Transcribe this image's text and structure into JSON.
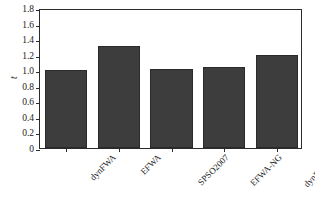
{
  "chart_data": {
    "type": "bar",
    "title": "",
    "subtitle": "",
    "xlabel": "",
    "ylabel": "t",
    "categories": [
      "dynFWA",
      "EFWA",
      "SPSO2007",
      "EFWA-NG",
      "dynFWA-G"
    ],
    "values": [
      1.0,
      1.31,
      1.02,
      1.04,
      1.19
    ],
    "ylim": [
      0,
      1.8
    ],
    "ytick_labels": [
      "0",
      "0.2",
      "0.4",
      "0.6",
      "0.8",
      "1.0",
      "1.2",
      "1.4",
      "1.6",
      "1.8"
    ],
    "ytick_values": [
      0,
      0.2,
      0.4,
      0.6,
      0.8,
      1.0,
      1.2,
      1.4,
      1.6,
      1.8
    ],
    "grid": false,
    "legend": null,
    "legend_position": "none",
    "annotations": [],
    "bar_color": "#3d3d3d",
    "bar_edge_color": "#2a2a2a",
    "axis_color": "#2b2b2b",
    "background_color": "#ffffff",
    "xtick_label_rotation": "-45"
  }
}
